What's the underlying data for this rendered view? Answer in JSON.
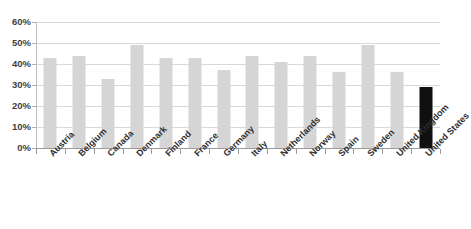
{
  "chart_data": {
    "type": "bar",
    "title": "",
    "xlabel": "",
    "ylabel": "",
    "ylim": [
      0,
      60
    ],
    "ytick_labels": [
      "60%",
      "50%",
      "40%",
      "30%",
      "20%",
      "10%",
      "0%"
    ],
    "ytick_values": [
      60,
      50,
      40,
      30,
      20,
      10,
      0
    ],
    "grid": true,
    "legend": "none",
    "categories": [
      "Austria",
      "Belgium",
      "Canada",
      "Denmark",
      "Finland",
      "France",
      "Germany",
      "Italy",
      "Netherlands",
      "Norway",
      "Spain",
      "Sweden",
      "United Kingdom",
      "United States"
    ],
    "values": [
      43,
      44,
      33,
      49,
      43,
      43,
      37,
      44,
      41,
      44,
      36,
      49,
      36,
      29
    ],
    "highlight_category": "United States",
    "colors": {
      "bar": "#d5d5d5",
      "bar_highlight": "#101010",
      "gridline": "#d9d9d9",
      "axis": "#9a9a9a",
      "tick_text": "#3f3f3f",
      "category_text": "#2e2e2e"
    }
  }
}
